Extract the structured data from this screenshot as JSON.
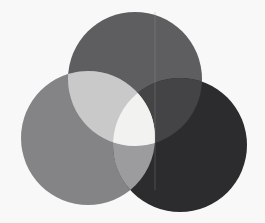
{
  "figure": {
    "name": "three-circle-venn-diagram",
    "type": "venn",
    "width": 265,
    "height": 223,
    "background_color": "#f8f8f9",
    "blend_mode": "lighten",
    "title": "",
    "caption": ""
  },
  "chart_data": {
    "type": "venn",
    "title": "",
    "subtitle": "",
    "xlabel": "",
    "ylabel": "",
    "legend_position": "none",
    "grid": false,
    "sets": [
      {
        "id": "top",
        "label": "",
        "color": "#5e5e60",
        "center_x": 135,
        "center_y": 79,
        "radius": 67
      },
      {
        "id": "left",
        "label": "",
        "color": "#848486",
        "center_x": 88,
        "center_y": 138,
        "radius": 67
      },
      {
        "id": "right",
        "label": "",
        "color": "#2c2c2f",
        "center_x": 180,
        "center_y": 145,
        "radius": 67
      }
    ],
    "regions": [
      {
        "id": "top-only",
        "sets": [
          "top"
        ],
        "color": "#5e5e60"
      },
      {
        "id": "left-only",
        "sets": [
          "left"
        ],
        "color": "#848486"
      },
      {
        "id": "right-only",
        "sets": [
          "right"
        ],
        "color": "#2c2c2f"
      },
      {
        "id": "top-left",
        "sets": [
          "top",
          "left"
        ],
        "color": "#c9c9ca"
      },
      {
        "id": "top-right",
        "sets": [
          "top",
          "right"
        ],
        "color": "#444446"
      },
      {
        "id": "left-right",
        "sets": [
          "left",
          "right"
        ],
        "color": "#9c9c9e"
      },
      {
        "id": "top-left-right",
        "sets": [
          "top",
          "left",
          "right"
        ],
        "color": "#f2f2f1"
      }
    ],
    "artifacts": [
      {
        "id": "vertical-seam",
        "kind": "line",
        "x": 155,
        "y_start": 12,
        "y_end": 190,
        "color": "#9a9a9c"
      }
    ]
  }
}
